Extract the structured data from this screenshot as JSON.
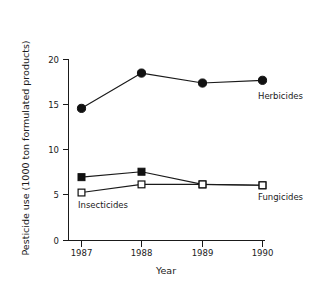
{
  "chart_data": {
    "type": "line",
    "title": "",
    "xlabel": "Year",
    "ylabel": "Pesticide use (1000 ton formulated products)",
    "categories": [
      "1987",
      "1988",
      "1989",
      "1990"
    ],
    "x": [
      1987,
      1988,
      1989,
      1990
    ],
    "xlim": [
      1986.6,
      1990.4
    ],
    "ylim": [
      0,
      20
    ],
    "yticks": [
      0,
      5,
      10,
      15,
      20
    ],
    "ytick_labels": [
      "0",
      "5",
      "10",
      "15",
      "20"
    ],
    "xtick_labels": [
      "1987",
      "1988",
      "1989",
      "1990"
    ],
    "grid": false,
    "legend_position": "inline-annotations",
    "series": [
      {
        "name": "Herbicides",
        "marker": "filled-circle",
        "label_text": "Herbicides",
        "values": [
          14.6,
          18.5,
          17.4,
          17.7
        ]
      },
      {
        "name": "Fungicides",
        "marker": "filled-square",
        "label_text": "Fungicides",
        "values": [
          7.0,
          7.6,
          6.2,
          6.1
        ]
      },
      {
        "name": "Insecticides",
        "marker": "open-square",
        "label_text": "Insecticides",
        "values": [
          5.3,
          6.2,
          6.2,
          6.1
        ]
      }
    ],
    "annotations": [
      {
        "text": "Herbicides",
        "x": 1990,
        "y": 17.7
      },
      {
        "text": "Fungicides",
        "x": 1990,
        "y": 6.1
      },
      {
        "text": "Insecticides",
        "x": 1987,
        "y": 5.3
      }
    ],
    "colors": {
      "axis": "#1a1a1a",
      "line": "#1a1a1a",
      "marker_fill": "#111111",
      "marker_open_fill": "#ffffff",
      "background": "#ffffff"
    }
  }
}
